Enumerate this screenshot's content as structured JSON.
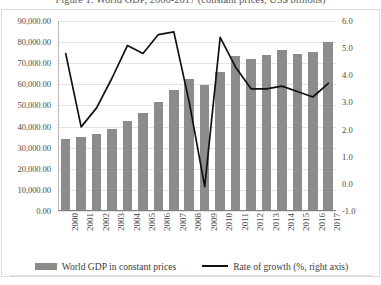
{
  "figure": {
    "caption": "Figure 1: World GDP, 2000-2017 (constant prices, US$ billions)"
  },
  "legend": {
    "bar_label": "World GDP in constant prices",
    "line_label": "Rate of growth (%, right axis)"
  },
  "colors": {
    "bar": "#8c8c8c",
    "line": "#111111",
    "grid": "#e3e3e3",
    "axis": "#808080",
    "text": "#4a4a4a"
  },
  "chart_data": {
    "type": "bar",
    "title": "Figure 1: World GDP, 2000-2017 (constant prices, US$ billions)",
    "xlabel": "",
    "ylabel": "",
    "categories": [
      "2000",
      "2001",
      "2002",
      "2003",
      "2004",
      "2005",
      "2006",
      "2007",
      "2008",
      "2009",
      "2010",
      "2011",
      "2012",
      "2013",
      "2014",
      "2015",
      "2016",
      "2017"
    ],
    "series": [
      {
        "name": "World GDP in constant prices",
        "type": "bar",
        "axis": "left",
        "values": [
          34000.0,
          35000.0,
          36500.0,
          39000.0,
          42500.0,
          46500.0,
          51500.0,
          57500.0,
          62500.0,
          59500.0,
          66000.0,
          73500.0,
          72000.0,
          74000.0,
          76500.0,
          74500.0,
          75500.0,
          80000.0
        ]
      },
      {
        "name": "Rate of growth (%, right axis)",
        "type": "line",
        "axis": "right",
        "values": [
          4.8,
          2.1,
          2.8,
          3.9,
          5.1,
          4.8,
          5.5,
          5.6,
          3.0,
          -0.1,
          5.4,
          4.3,
          3.5,
          3.5,
          3.6,
          3.4,
          3.2,
          3.7
        ]
      }
    ],
    "ylim": [
      0,
      90000
    ],
    "yticks": [
      "0.00",
      "10,000.00",
      "20,000.00",
      "30,000.00",
      "40,000.00",
      "50,000.00",
      "60,000.00",
      "70,000.00",
      "80,000.00",
      "90,000.00"
    ],
    "y2lim": [
      -1.0,
      6.0
    ],
    "y2ticks": [
      "-1.0",
      "0.0",
      "1.0",
      "2.0",
      "3.0",
      "4.0",
      "5.0",
      "6.0"
    ],
    "grid": true,
    "legend_position": "bottom"
  }
}
